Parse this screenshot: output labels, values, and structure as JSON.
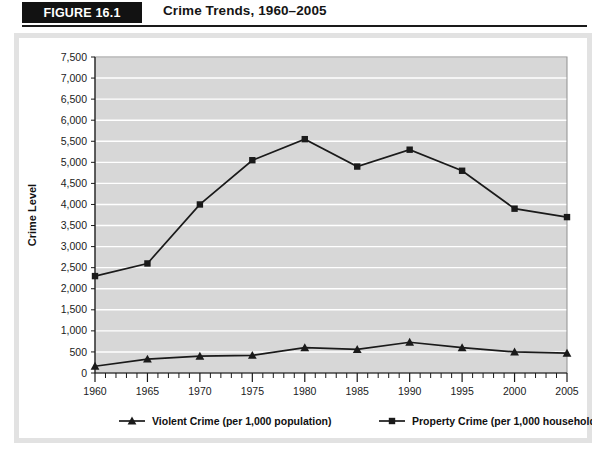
{
  "figure": {
    "badge": "FIGURE 16.1",
    "title": "Crime Trends, 1960–2005"
  },
  "chart_data": {
    "type": "line",
    "title": "Crime Trends, 1960–2005",
    "xlabel": "",
    "ylabel": "Crime Level",
    "x": [
      1960,
      1965,
      1970,
      1975,
      1980,
      1985,
      1990,
      1995,
      2000,
      2005
    ],
    "xtick_labels": [
      "1960",
      "1965",
      "1970",
      "1975",
      "1980",
      "1985",
      "1990",
      "1995",
      "2000",
      "2005"
    ],
    "xlim": [
      1960,
      2005
    ],
    "ylim": [
      0,
      7500
    ],
    "ytick_values": [
      0,
      500,
      1000,
      1500,
      2000,
      2500,
      3000,
      3500,
      4000,
      4500,
      5000,
      5500,
      6000,
      6500,
      7000,
      7500
    ],
    "ytick_labels": [
      "0",
      "500",
      "1,000",
      "1,500",
      "2,000",
      "2,500",
      "3,000",
      "3,500",
      "4,000",
      "4,500",
      "5,000",
      "5,500",
      "6,000",
      "6,500",
      "7,000",
      "7,500"
    ],
    "grid": true,
    "grid_color": "#ffffff",
    "plot_background": "#d7d7d7",
    "legend_position": "bottom",
    "series": [
      {
        "name": "Violent Crime (per 1,000 population)",
        "marker": "triangle",
        "color": "#1a1a1a",
        "values": [
          160,
          330,
          400,
          420,
          600,
          560,
          730,
          600,
          500,
          470
        ]
      },
      {
        "name": "Property Crime (per 1,000 households)",
        "marker": "square",
        "color": "#1a1a1a",
        "values": [
          2300,
          2600,
          4000,
          5050,
          5550,
          4900,
          5300,
          4800,
          3900,
          3700
        ]
      }
    ]
  }
}
